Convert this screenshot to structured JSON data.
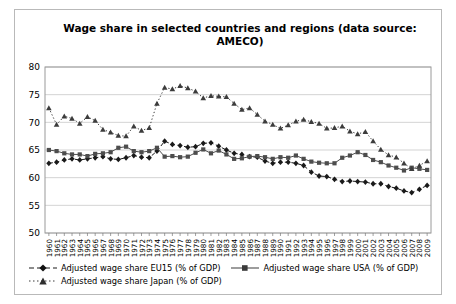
{
  "chart_data": {
    "type": "line",
    "title": "Wage share in selected countries and regions (data source: AMECO)",
    "xlabel": "",
    "ylabel": "",
    "ylim": [
      50,
      80
    ],
    "yticks": [
      50,
      55,
      60,
      65,
      70,
      75,
      80
    ],
    "grid": true,
    "legend_position": "bottom",
    "categories": [
      "1960",
      "1961",
      "1962",
      "1963",
      "1964",
      "1965",
      "1966",
      "1967",
      "1968",
      "1969",
      "1970",
      "1971",
      "1972",
      "1973",
      "1974",
      "1975",
      "1976",
      "1977",
      "1978",
      "1979",
      "1980",
      "1981",
      "1982",
      "1983",
      "1984",
      "1985",
      "1986",
      "1987",
      "1988",
      "1989",
      "1990",
      "1991",
      "1992",
      "1993",
      "1994",
      "1995",
      "1996",
      "1997",
      "1998",
      "1999",
      "2000",
      "2001",
      "2002",
      "2003",
      "2004",
      "2005",
      "2006",
      "2007",
      "2008",
      "2009"
    ],
    "series": [
      {
        "name": "Adjusted wage share EU15 (% of GDP)",
        "marker": "diamond",
        "dash": "dashed",
        "color": "#1a1a1a",
        "values": [
          62.6,
          62.8,
          63.2,
          63.4,
          63.2,
          63.4,
          63.6,
          63.8,
          63.4,
          63.3,
          63.6,
          64.0,
          63.7,
          63.6,
          64.8,
          66.6,
          66.0,
          65.8,
          65.5,
          65.6,
          66.2,
          66.3,
          65.7,
          65.0,
          64.4,
          64.2,
          63.8,
          63.7,
          63.0,
          62.6,
          62.8,
          62.8,
          62.6,
          62.2,
          61.0,
          60.3,
          60.2,
          59.7,
          59.3,
          59.4,
          59.3,
          59.2,
          58.9,
          58.9,
          58.4,
          58.1,
          57.6,
          57.3,
          57.9,
          58.6
        ]
      },
      {
        "name": "Adjusted wage share USA (% of GDP)",
        "marker": "square",
        "dash": "solid",
        "color": "#4d4d4d",
        "values": [
          65.0,
          64.8,
          64.4,
          64.2,
          64.2,
          63.9,
          64.3,
          64.4,
          64.6,
          65.4,
          65.6,
          64.8,
          64.6,
          64.8,
          65.4,
          63.8,
          63.9,
          63.7,
          63.8,
          64.5,
          65.1,
          64.4,
          64.9,
          64.2,
          63.4,
          63.5,
          63.8,
          63.9,
          63.7,
          63.4,
          63.7,
          63.6,
          64.0,
          63.4,
          62.9,
          62.7,
          62.6,
          62.6,
          63.6,
          64.0,
          64.6,
          64.1,
          63.2,
          62.8,
          62.2,
          61.8,
          61.3,
          61.8,
          61.6,
          61.4
        ]
      },
      {
        "name": "Adjusted wage share Japan (% of GDP)",
        "marker": "triangle",
        "dash": "dotted",
        "color": "#3c3c3c",
        "values": [
          72.6,
          69.6,
          71.1,
          70.7,
          69.8,
          71.0,
          70.3,
          68.7,
          68.2,
          67.6,
          67.5,
          69.3,
          68.5,
          69.0,
          73.4,
          76.3,
          76.0,
          76.6,
          76.2,
          75.6,
          74.4,
          74.8,
          74.7,
          74.6,
          73.4,
          72.3,
          72.6,
          71.4,
          70.2,
          69.6,
          68.9,
          69.5,
          70.2,
          70.5,
          70.1,
          69.8,
          68.9,
          69.0,
          69.3,
          68.4,
          67.9,
          68.3,
          66.6,
          65.1,
          64.1,
          63.7,
          62.6,
          61.6,
          62.2,
          63.0
        ]
      }
    ]
  }
}
